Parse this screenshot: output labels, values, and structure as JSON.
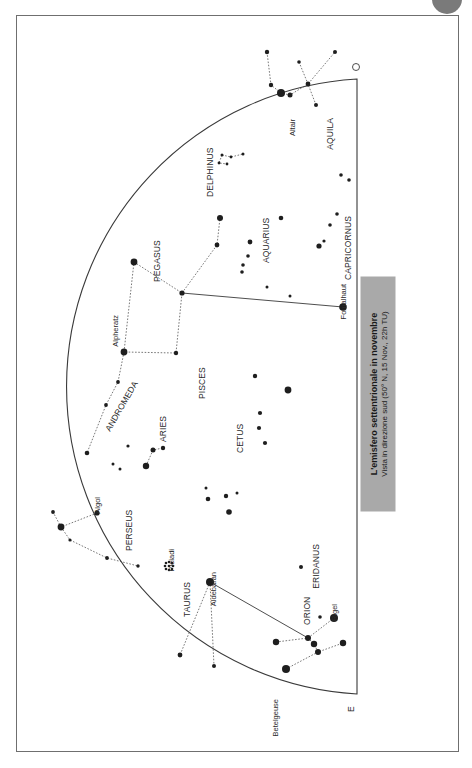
{
  "caption": {
    "title": "L'emisfero settentrionale in novembre",
    "subtitle": "Vista in direzione sud (50° N, 15 Nov., 22h TU)"
  },
  "directions": {
    "west_marker": "O",
    "east_marker": "E"
  },
  "constellations": [
    {
      "name": "AQUILA"
    },
    {
      "name": "DELPHINUS"
    },
    {
      "name": "AQUARIUS"
    },
    {
      "name": "CAPRICORNUS"
    },
    {
      "name": "PEGASUS"
    },
    {
      "name": "ANDROMEDA"
    },
    {
      "name": "PISCES"
    },
    {
      "name": "ARIES"
    },
    {
      "name": "CETUS"
    },
    {
      "name": "PERSEUS"
    },
    {
      "name": "TAURUS"
    },
    {
      "name": "ERIDANUS"
    },
    {
      "name": "ORION"
    }
  ],
  "stars": [
    {
      "name": "Altair"
    },
    {
      "name": "Fomalhaut"
    },
    {
      "name": "Alpheratz"
    },
    {
      "name": "Algol"
    },
    {
      "name": "Pleiadi"
    },
    {
      "name": "Aldebaran"
    },
    {
      "name": "Rigel"
    },
    {
      "name": "Betelgeuse"
    }
  ],
  "colors": {
    "ink": "#2a2a2a",
    "caption_bg": "#a9a9a9",
    "frame": "#6f6f6f"
  }
}
